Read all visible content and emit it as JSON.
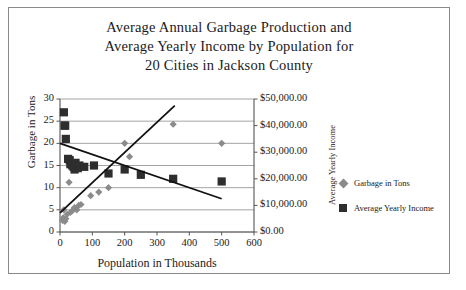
{
  "figure": {
    "title_lines": [
      "Average Annual Garbage Production and",
      "Average Yearly Income by Population for",
      "20 Cities in Jackson County"
    ],
    "colors": {
      "garbage_marker": "#8b8b8b",
      "income_marker": "#2e2e2e",
      "gridline": "#9a9a9a",
      "axis": "#555555",
      "trendline": "#111111",
      "frame_border": "#8a8a8a",
      "background": "#ffffff"
    }
  },
  "legend": {
    "position": "right",
    "items": [
      {
        "label": "Garbage in Tons",
        "marker": "diamond",
        "color": "#8b8b8b"
      },
      {
        "label": "Average Yearly Income",
        "marker": "square",
        "color": "#2e2e2e"
      }
    ]
  },
  "chart_data": {
    "type": "scatter",
    "title": "Average Annual Garbage Production and Average Yearly Income by Population for 20 Cities in Jackson County",
    "xlabel": "Population in Thousands",
    "ylabel": "Garbage in Tons",
    "y2label": "Average Yearly Income",
    "xlim": [
      0,
      600
    ],
    "ylim": [
      0,
      30
    ],
    "y2lim": [
      0,
      50000
    ],
    "xticks": [
      0,
      100,
      200,
      300,
      400,
      500,
      600
    ],
    "xticklabels": [
      "0",
      "100",
      "200",
      "300",
      "400",
      "500",
      "600"
    ],
    "yticks": [
      0,
      5,
      10,
      15,
      20,
      25,
      30
    ],
    "yticklabels": [
      "0",
      "5",
      "10",
      "15",
      "20",
      "25",
      "30"
    ],
    "y2ticks": [
      0,
      10000,
      20000,
      30000,
      40000,
      50000
    ],
    "y2ticklabels": [
      "$0.00",
      "$10,000.00",
      "$20,000.00",
      "$30,000.00",
      "$40,000.00",
      "$50,000.00"
    ],
    "grid": "horizontal",
    "series": [
      {
        "name": "Garbage in Tons",
        "marker": "diamond",
        "color": "#8b8b8b",
        "axis": "left",
        "points": [
          [
            8,
            2.6
          ],
          [
            10,
            3.2
          ],
          [
            12,
            5.0
          ],
          [
            15,
            2.4
          ],
          [
            18,
            3.0
          ],
          [
            22,
            4.0
          ],
          [
            28,
            11.2
          ],
          [
            32,
            4.4
          ],
          [
            38,
            4.8
          ],
          [
            45,
            5.5
          ],
          [
            52,
            5.0
          ],
          [
            58,
            6.0
          ],
          [
            65,
            6.2
          ],
          [
            95,
            8.2
          ],
          [
            120,
            9.0
          ],
          [
            150,
            10.0
          ],
          [
            200,
            20.0
          ],
          [
            215,
            17.0
          ],
          [
            350,
            24.3
          ],
          [
            500,
            20.0
          ]
        ]
      },
      {
        "name": "Average Yearly Income",
        "marker": "square",
        "color": "#2e2e2e",
        "axis": "right",
        "points": [
          [
            12,
            45000
          ],
          [
            14,
            40000
          ],
          [
            16,
            40000
          ],
          [
            18,
            35000
          ],
          [
            25,
            27500
          ],
          [
            30,
            27000
          ],
          [
            32,
            25500
          ],
          [
            38,
            25000
          ],
          [
            42,
            24500
          ],
          [
            45,
            23500
          ],
          [
            48,
            26000
          ],
          [
            55,
            24000
          ],
          [
            60,
            25000
          ],
          [
            75,
            24500
          ],
          [
            105,
            25000
          ],
          [
            150,
            22000
          ],
          [
            200,
            23500
          ],
          [
            250,
            21500
          ],
          [
            350,
            20000
          ],
          [
            500,
            19000
          ]
        ]
      }
    ],
    "trendlines": [
      {
        "name": "income-trend-decreasing",
        "for_series": "Average Yearly Income",
        "axis": "left_equivalent",
        "x_start": 0,
        "y_start": 20.0,
        "x_end": 500,
        "y_end": 7.5
      },
      {
        "name": "garbage-trend-increasing",
        "for_series": "Garbage in Tons",
        "axis": "left",
        "x_start": 0,
        "y_start": 4.3,
        "x_end": 355,
        "y_end": 28.5
      }
    ]
  }
}
